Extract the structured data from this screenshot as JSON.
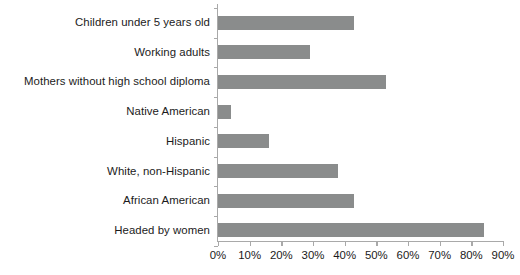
{
  "chart_data": {
    "type": "bar",
    "orientation": "horizontal",
    "title": "",
    "subtitle": "",
    "xlabel": "",
    "ylabel": "",
    "categories": [
      "Children under 5 years old",
      "Working adults",
      "Mothers without high school diploma",
      "Native American",
      "Hispanic",
      "White, non-Hispanic",
      "African American",
      "Headed by women"
    ],
    "values": [
      43,
      29,
      53,
      4,
      16,
      38,
      43,
      84
    ],
    "value_unit": "%",
    "xlim": [
      0,
      90
    ],
    "xtick_values": [
      0,
      10,
      20,
      30,
      40,
      50,
      60,
      70,
      80,
      90
    ],
    "xtick_labels": [
      "0%",
      "10%",
      "20%",
      "30%",
      "40%",
      "50%",
      "60%",
      "70%",
      "80%",
      "90%"
    ],
    "grid": false,
    "legend": null,
    "legend_position": "none",
    "bar_color": "#8a8c8c",
    "axis_color": "#a9a9a9",
    "text_color": "#1b1b1b",
    "background_color": "#ffffff"
  }
}
